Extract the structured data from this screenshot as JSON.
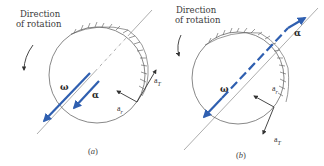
{
  "figure": {
    "panels": [
      {
        "id": "a",
        "caption_letter": "a",
        "direction_label_line1": "Direction",
        "direction_label_line2": "of rotation",
        "omega_symbol": "ω",
        "alpha_symbol": "α",
        "radial_accel_base": "a",
        "radial_accel_sub": "r",
        "tangential_accel_base": "a",
        "tangential_accel_sub": "T",
        "description": "ω and α both along the axis pointing the same direction (speeding up)"
      },
      {
        "id": "b",
        "caption_letter": "b",
        "direction_label_line1": "Direction",
        "direction_label_line2": "of rotation",
        "omega_symbol": "ω",
        "alpha_symbol": "α",
        "radial_accel_base": "a",
        "radial_accel_sub": "r",
        "tangential_accel_base": "a",
        "tangential_accel_sub": "T",
        "description": "ω and α along the axis pointing opposite directions (slowing down)"
      }
    ],
    "colors": {
      "vector_blue": "#2f5fb0",
      "line_gray": "#555555",
      "axis_gray": "#8a8a8a"
    }
  }
}
